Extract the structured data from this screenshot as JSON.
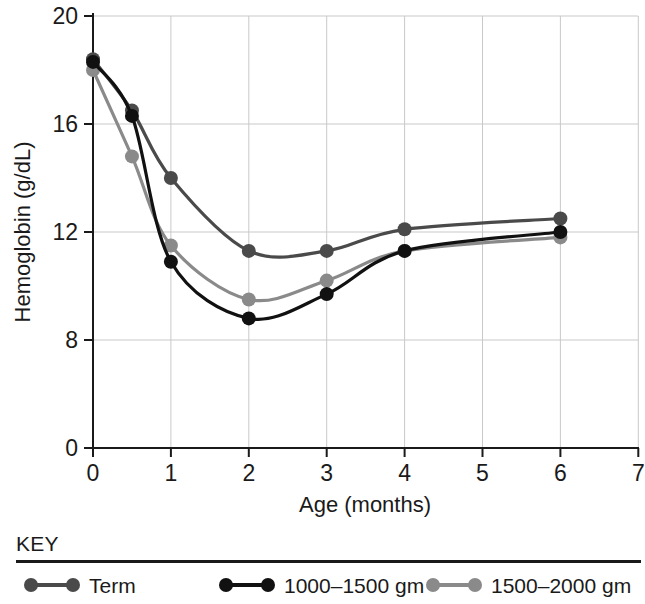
{
  "chart_data": {
    "type": "line",
    "title": "",
    "xlabel": "Age (months)",
    "ylabel": "Hemoglobin (g/dL)",
    "x": [
      0,
      0.5,
      1,
      2,
      3,
      4,
      6
    ],
    "xlim": [
      0,
      7
    ],
    "ylim": [
      0,
      20
    ],
    "xticks": [
      "0",
      "1",
      "2",
      "3",
      "4",
      "5",
      "6",
      "7"
    ],
    "yticks": [
      "0",
      "8",
      "12",
      "16",
      "20"
    ],
    "grid": true,
    "legend_position": "bottom",
    "legend_title": "KEY",
    "series": [
      {
        "name": "Term",
        "color": "#4a4a4a",
        "x": [
          0,
          0.5,
          1,
          2,
          3,
          4,
          6
        ],
        "values": [
          18.4,
          16.5,
          14.0,
          11.3,
          11.3,
          12.1,
          12.5
        ]
      },
      {
        "name": "1000–1500 gm",
        "color": "#111111",
        "x": [
          0,
          0.5,
          1,
          2,
          3,
          4,
          6
        ],
        "values": [
          18.3,
          16.3,
          10.9,
          8.8,
          9.7,
          11.3,
          12.0
        ]
      },
      {
        "name": "1500–2000 gm",
        "color": "#8a8a8a",
        "x": [
          0,
          0.5,
          1,
          2,
          3,
          4,
          6
        ],
        "values": [
          18.0,
          14.8,
          11.5,
          9.5,
          10.2,
          11.3,
          11.8
        ]
      }
    ]
  },
  "axes": {
    "y_title": "Hemoglobin (g/dL)",
    "x_title": "Age (months)",
    "y_tick_labels": [
      "20",
      "16",
      "12",
      "8",
      "0"
    ],
    "x_tick_labels": [
      "0",
      "1",
      "2",
      "3",
      "4",
      "5",
      "6",
      "7"
    ]
  },
  "legend": {
    "title": "KEY",
    "items": [
      {
        "label": "Term",
        "color": "#4a4a4a"
      },
      {
        "label": "1000–1500 gm",
        "color": "#111111"
      },
      {
        "label": "1500–2000 gm",
        "color": "#8a8a8a"
      }
    ]
  }
}
